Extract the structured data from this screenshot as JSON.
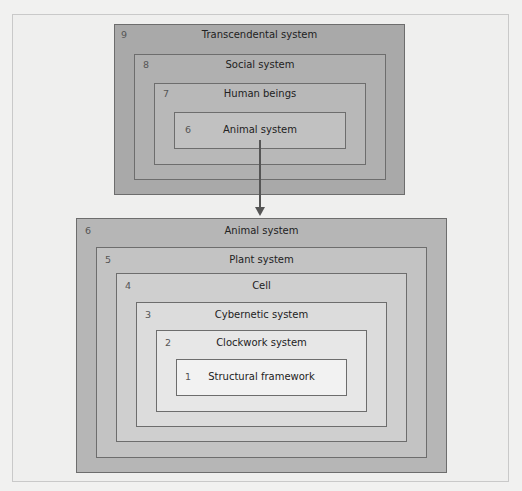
{
  "diagram": {
    "top_group": [
      {
        "level": "9",
        "label": "Transcendental system",
        "fill": "#a9a9a9"
      },
      {
        "level": "8",
        "label": "Social system",
        "fill": "#b0b0b0"
      },
      {
        "level": "7",
        "label": "Human beings",
        "fill": "#b8b8b8"
      },
      {
        "level": "6",
        "label": "Animal system",
        "fill": "#c1c1c1"
      }
    ],
    "bottom_group": [
      {
        "level": "6",
        "label": "Animal system",
        "fill": "#b6b6b6"
      },
      {
        "level": "5",
        "label": "Plant system",
        "fill": "#c3c3c3"
      },
      {
        "level": "4",
        "label": "Cell",
        "fill": "#cfcfcf"
      },
      {
        "level": "3",
        "label": "Cybernetic system",
        "fill": "#dcdcdc"
      },
      {
        "level": "2",
        "label": "Clockwork system",
        "fill": "#e7e7e7"
      },
      {
        "level": "1",
        "label": "Structural framework",
        "fill": "#f2f2f2"
      }
    ],
    "connector": {
      "from": "top_group.6 Animal system",
      "to": "bottom_group.6 Animal system",
      "type": "arrow-down"
    },
    "border_color": "#6d6d6d",
    "background": "#efefee"
  }
}
